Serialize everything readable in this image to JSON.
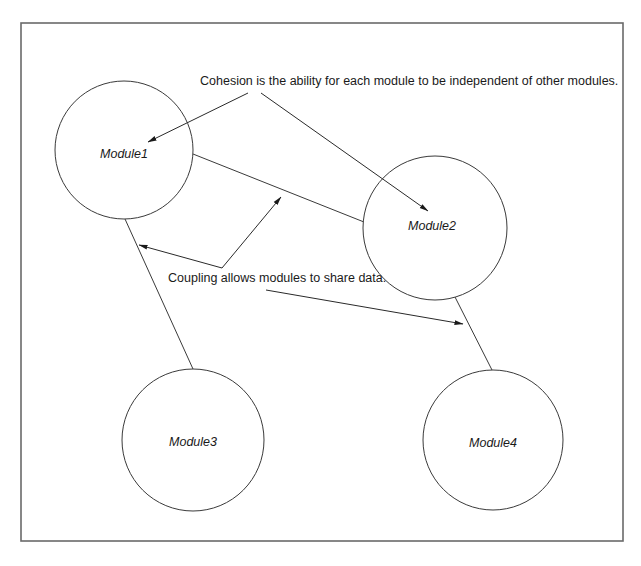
{
  "diagram": {
    "modules": [
      {
        "id": "module1",
        "label": "Module1",
        "cx": 124,
        "cy": 150,
        "r": 69
      },
      {
        "id": "module2",
        "label": "Module2",
        "cx": 435,
        "cy": 228,
        "r": 72
      },
      {
        "id": "module3",
        "label": "Module3",
        "cx": 193,
        "cy": 440,
        "r": 71
      },
      {
        "id": "module4",
        "label": "Module4",
        "cx": 493,
        "cy": 440,
        "r": 70
      }
    ],
    "connections": [
      {
        "from": "Module1",
        "to": "Module2"
      },
      {
        "from": "Module1",
        "to": "Module3"
      },
      {
        "from": "Module2",
        "to": "Module4"
      }
    ],
    "annotations": {
      "cohesion": {
        "text": "Cohesion is the ability for each module to be independent of other modules.",
        "points_to": [
          "Module1",
          "Module2"
        ]
      },
      "coupling": {
        "text": "Coupling allows modules to share data.",
        "points_to": [
          "Module1–Module3 connection",
          "Module1–Module2 connection",
          "Module2–Module4 connection"
        ]
      }
    },
    "colors": {
      "background": "#ffffff",
      "frame": "#6a6a6a",
      "stroke": "#3a3a3a",
      "text": "#1a1a1a"
    }
  }
}
